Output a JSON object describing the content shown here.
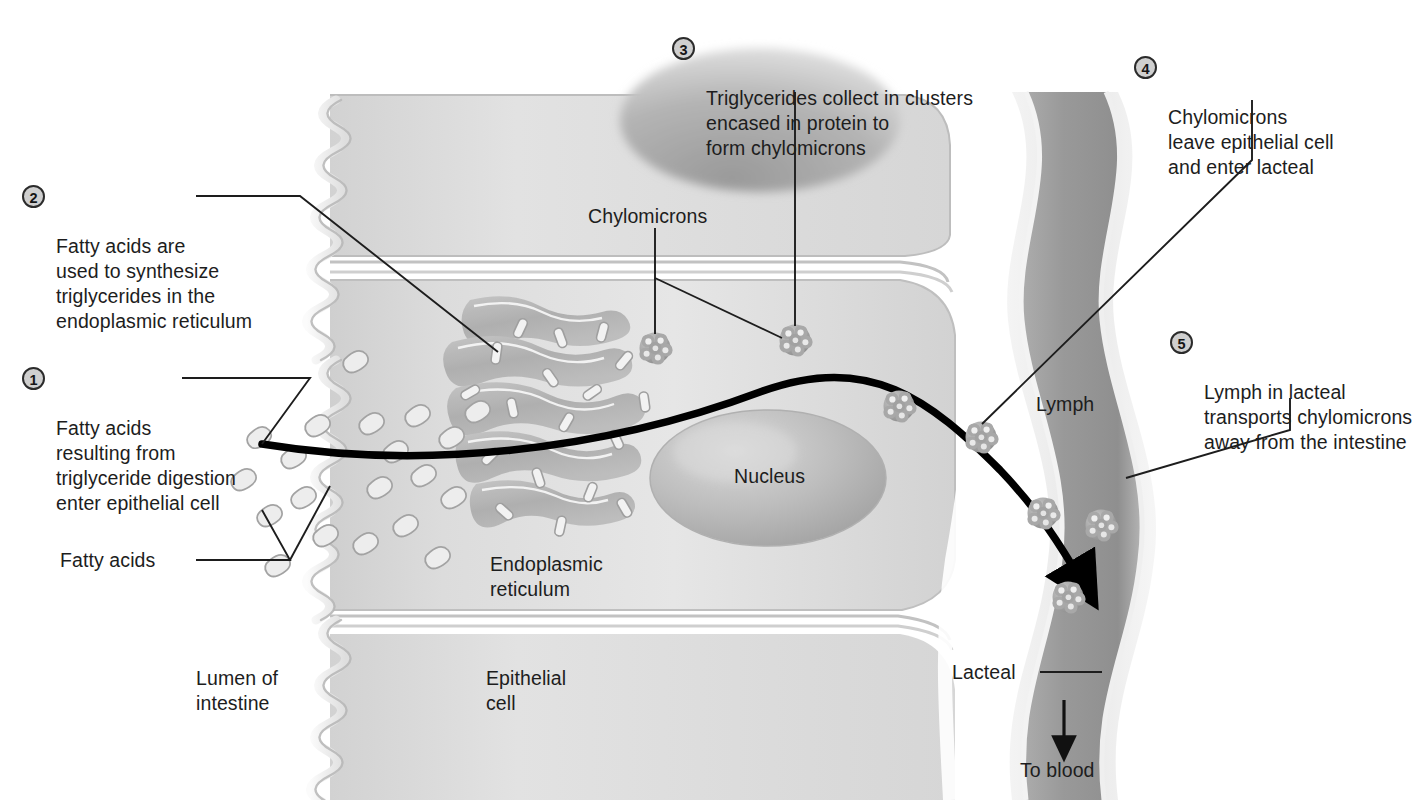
{
  "figure": {
    "ink_color": "#1d1d1d",
    "badge_fill": "#cfcfcf",
    "badge_ring": "#2b2b2b",
    "cell_fill": "#d8d8d8",
    "lumen_fill": "#ffffff",
    "lacteal_fill": "#9b9b9b",
    "arrow_color": "#000000"
  },
  "steps": [
    {
      "number": "1",
      "text": "Fatty acids\nresulting from\ntriglyceride digestion\nenter epithelial cell"
    },
    {
      "number": "2",
      "text": "Fatty acids are\nused to synthesize\ntriglycerides in the\nendoplasmic reticulum"
    },
    {
      "number": "3",
      "text": "Triglycerides collect in clusters\nencased in protein to\nform chylomicrons"
    },
    {
      "number": "4",
      "text": "Chylomicrons\nleave epithelial cell\nand enter lacteal"
    },
    {
      "number": "5",
      "text": "Lymph in lacteal\ntransports chylomicrons\naway from the intestine"
    }
  ],
  "structure_labels": [
    {
      "key": "fatty_acids",
      "text": "Fatty acids"
    },
    {
      "key": "chylomicrons",
      "text": "Chylomicrons"
    },
    {
      "key": "lumen",
      "text": "Lumen of\nintestine"
    },
    {
      "key": "epithelial",
      "text": "Epithelial\ncell"
    },
    {
      "key": "er",
      "text": "Endoplasmic\nreticulum"
    },
    {
      "key": "nucleus",
      "text": "Nucleus"
    },
    {
      "key": "lymph",
      "text": "Lymph"
    },
    {
      "key": "lacteal",
      "text": "Lacteal"
    },
    {
      "key": "to_blood",
      "text": "To blood"
    }
  ]
}
